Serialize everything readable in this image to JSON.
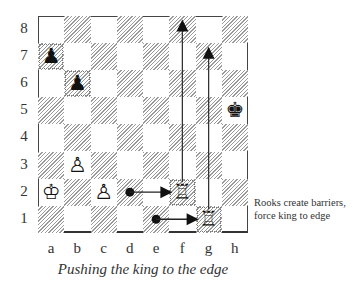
{
  "diagram": {
    "caption": "Pushing the king to the edge",
    "annotation": "Rooks create barriers, force king to edge",
    "ranks": [
      "8",
      "7",
      "6",
      "5",
      "4",
      "3",
      "2",
      "1"
    ],
    "files": [
      "a",
      "b",
      "c",
      "d",
      "e",
      "f",
      "g",
      "h"
    ],
    "pieces": [
      {
        "square": "a7",
        "piece": "black-pawn",
        "glyph": "♟"
      },
      {
        "square": "b6",
        "piece": "black-pawn",
        "glyph": "♟"
      },
      {
        "square": "h5",
        "piece": "black-king",
        "glyph": "♚"
      },
      {
        "square": "b3",
        "piece": "white-pawn",
        "glyph": "♙"
      },
      {
        "square": "a2",
        "piece": "white-king",
        "glyph": "♔"
      },
      {
        "square": "c2",
        "piece": "white-pawn",
        "glyph": "♙"
      },
      {
        "square": "f2",
        "piece": "white-rook",
        "glyph": "♖"
      },
      {
        "square": "g1",
        "piece": "white-rook",
        "glyph": "♖"
      }
    ],
    "arrows": [
      {
        "from": "d2",
        "to": "f2",
        "style": "dot-arrow"
      },
      {
        "from": "e1",
        "to": "g1",
        "style": "dot-arrow"
      },
      {
        "from": "f2",
        "to": "f8",
        "style": "line-arrow"
      },
      {
        "from": "g1",
        "to": "g7",
        "style": "line-arrow"
      }
    ]
  }
}
